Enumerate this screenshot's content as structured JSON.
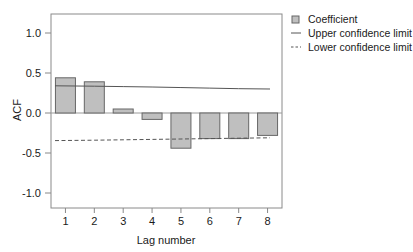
{
  "chart_data": {
    "type": "bar",
    "title": "",
    "xlabel": "Lag number",
    "ylabel": "ACF",
    "categories": [
      "1",
      "2",
      "3",
      "4",
      "5",
      "6",
      "7",
      "8"
    ],
    "values": [
      0.44,
      0.39,
      0.05,
      -0.08,
      -0.44,
      -0.32,
      -0.32,
      -0.28
    ],
    "series": [
      {
        "name": "Coefficient",
        "values": [
          0.44,
          0.39,
          0.05,
          -0.08,
          -0.44,
          -0.32,
          -0.32,
          -0.28
        ]
      },
      {
        "name": "Upper confidence limit",
        "values": [
          0.34,
          0.335,
          0.33,
          0.325,
          0.318,
          0.311,
          0.304,
          0.3
        ]
      },
      {
        "name": "Lower confidence limit",
        "values": [
          -0.345,
          -0.34,
          -0.335,
          -0.33,
          -0.325,
          -0.32,
          -0.315,
          -0.31
        ]
      }
    ],
    "ylim": [
      -1.0,
      1.0
    ],
    "yticks": [
      "1.0",
      "0.5",
      "0.0",
      "-0.5",
      "-1.0"
    ],
    "ytick_values": [
      1.0,
      0.5,
      0.0,
      -0.5,
      -1.0
    ],
    "xticks": [
      "1",
      "2",
      "3",
      "4",
      "5",
      "6",
      "7",
      "8"
    ],
    "grid": false,
    "legend_position": "top-right",
    "bar_fill_color": "#bfbfbf",
    "bar_stroke_color": "#666666",
    "line_color": "#555555",
    "axis_color": "#888888"
  },
  "legend": {
    "items": [
      {
        "label": "Coefficient",
        "marker": "square-swatch"
      },
      {
        "label": "Upper confidence limit",
        "marker": "solid-line"
      },
      {
        "label": "Lower confidence limit",
        "marker": "dashed-line"
      }
    ]
  },
  "axes": {
    "y_title": "ACF",
    "x_title": "Lag number"
  }
}
